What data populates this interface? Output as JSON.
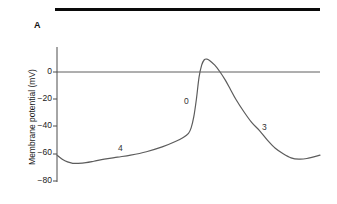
{
  "figure": {
    "panel_label": "A",
    "top_rule_color": "#0a0a0a"
  },
  "chart_data": {
    "type": "line",
    "title": "",
    "subtitle": "",
    "xlabel": "",
    "ylabel": "Membrane potential (mV)",
    "xlim": [
      0,
      100
    ],
    "ylim": [
      -80,
      10
    ],
    "grid": false,
    "legend": null,
    "x_axis_visible": false,
    "y_ticks": [
      0,
      -20,
      -40,
      -60,
      -80
    ],
    "y_tick_labels": [
      "0",
      "−20",
      "−40",
      "−60",
      "−80"
    ],
    "zero_reference_line": true,
    "zero_reference_value": 0,
    "line_color": "#5c5c5c",
    "axis_color": "#4d4d4d",
    "annotations": [
      {
        "text": "4",
        "x": 23,
        "y": -44,
        "phase": "phase-4-diastolic-depolarization"
      },
      {
        "text": "0",
        "x": 48,
        "y": -21,
        "phase": "phase-0-upstroke"
      },
      {
        "text": "3",
        "x": 77,
        "y": -40,
        "phase": "phase-3-repolarization"
      }
    ],
    "series": [
      {
        "name": "Pacemaker action potential",
        "x": [
          0,
          2,
          4,
          6,
          8,
          11,
          14,
          18,
          23,
          28,
          34,
          40,
          45,
          48,
          50,
          51,
          52,
          53,
          54,
          55,
          56,
          57,
          58,
          60,
          62,
          64,
          66,
          68,
          71,
          74,
          77,
          80,
          83,
          86,
          89,
          92,
          95,
          100
        ],
        "y": [
          -61,
          -64,
          -66,
          -67,
          -67,
          -66.5,
          -65.5,
          -64,
          -62.5,
          -61,
          -58.5,
          -55,
          -51,
          -48,
          -45,
          -41,
          -33,
          -20,
          -4,
          5,
          9,
          9.5,
          8.5,
          5,
          0,
          -6,
          -13,
          -20,
          -29,
          -37,
          -43,
          -50,
          -56,
          -60,
          -63,
          -64,
          -63.5,
          -61
        ]
      }
    ]
  },
  "geometry": {
    "axis_x_px": 57,
    "axis_top_px": 47,
    "axis_bottom_px": 182,
    "plot_right_px": 320,
    "y_zero_px": 72,
    "y_minus80_px": 181
  }
}
